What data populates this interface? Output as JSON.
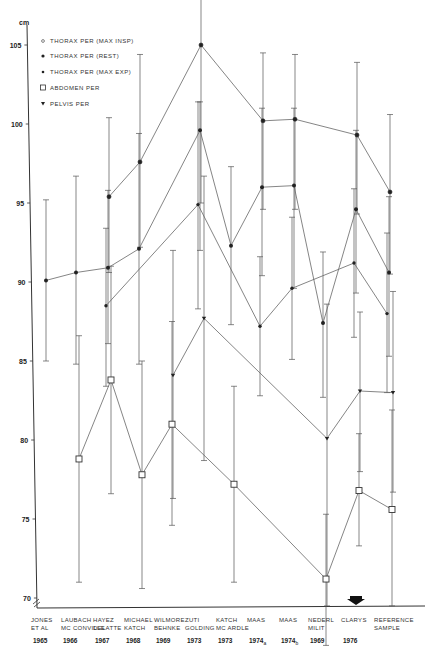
{
  "chart_data": {
    "type": "line",
    "title": "",
    "ylabel": "cm",
    "xlabel": "",
    "ylim": [
      69,
      106
    ],
    "yticks": [
      70,
      75,
      80,
      85,
      90,
      95,
      100,
      105
    ],
    "grid": false,
    "legend_position": "upper-left",
    "categories": [
      {
        "line1": "JONES",
        "line2": "ET AL",
        "year": "1965",
        "x": 46
      },
      {
        "line1": "LAUBACH",
        "line2": "MC CONVILLE",
        "year": "1966",
        "x": 76
      },
      {
        "line1": "HAYEZ",
        "line2": "DELATTE",
        "year": "1967",
        "x": 108
      },
      {
        "line1": "MICHAEL",
        "line2": "KATCH",
        "year": "1968",
        "x": 139
      },
      {
        "line1": "WILMORE",
        "line2": "BEHNKE",
        "year": "1969",
        "x": 169
      },
      {
        "line1": "ZUTI",
        "line2": "GOLDING",
        "year": "1973",
        "x": 200
      },
      {
        "line1": "KATCH",
        "line2": "MC ARDLE",
        "year": "1973",
        "x": 231
      },
      {
        "line1": "MAAS",
        "line2": "",
        "year": "1974a",
        "x": 262
      },
      {
        "line1": "MAAS",
        "line2": "",
        "year": "1974b",
        "x": 294
      },
      {
        "line1": "NEDERL",
        "line2": "MILIT",
        "year": "1969",
        "x": 323
      },
      {
        "line1": "CLARYS",
        "line2": "",
        "year": "1976",
        "x": 356
      },
      {
        "line1": "REFERENCE",
        "line2": "SAMPLE",
        "year": "",
        "x": 389
      }
    ],
    "series": [
      {
        "name": "THORAX PER (MAX INSP)",
        "marker": "open-circle",
        "values": [
          null,
          null,
          95.4,
          97.6,
          null,
          105.0,
          null,
          100.2,
          100.3,
          null,
          99.3,
          95.7
        ],
        "err_low": [
          null,
          null,
          90.6,
          92.2,
          null,
          95.0,
          null,
          94.6,
          94.6,
          null,
          94.3,
          90.5
        ],
        "err_high": [
          null,
          null,
          100.4,
          104.4,
          null,
          110.0,
          null,
          104.5,
          104.4,
          null,
          103.9,
          100.6
        ]
      },
      {
        "name": "THORAX PER (REST)",
        "marker": "filled-dot",
        "values": [
          90.1,
          90.6,
          90.9,
          92.1,
          null,
          99.6,
          92.3,
          96.0,
          96.1,
          87.4,
          94.6,
          90.6
        ],
        "err_low": [
          85.0,
          84.8,
          86.1,
          84.8,
          null,
          92.0,
          87.3,
          90.4,
          89.6,
          82.7,
          89.3,
          85.3
        ],
        "err_high": [
          95.2,
          96.7,
          95.8,
          99.4,
          null,
          101.4,
          97.3,
          101.0,
          101.0,
          91.9,
          99.6,
          95.4
        ]
      },
      {
        "name": "THORAX PER (MAX EXP)",
        "marker": "filled-small",
        "values": [
          null,
          null,
          88.5,
          null,
          null,
          94.9,
          null,
          87.2,
          89.6,
          null,
          91.2,
          88.0
        ],
        "err_low": [
          null,
          null,
          83.4,
          null,
          null,
          88.3,
          null,
          82.8,
          85.1,
          null,
          86.5,
          83.0
        ],
        "err_high": [
          null,
          null,
          93.4,
          null,
          null,
          101.4,
          null,
          91.6,
          94.1,
          null,
          95.9,
          93.1
        ]
      },
      {
        "name": "ABDOMEN PER",
        "marker": "open-square",
        "values": [
          null,
          78.8,
          83.8,
          77.8,
          81.0,
          null,
          77.2,
          null,
          null,
          71.2,
          76.8,
          75.6
        ],
        "err_low": [
          null,
          71.0,
          76.6,
          70.6,
          74.6,
          null,
          71.0,
          null,
          null,
          67.0,
          73.3,
          69.5
        ],
        "err_high": [
          null,
          86.6,
          91.0,
          85.0,
          87.5,
          null,
          83.4,
          null,
          null,
          75.3,
          80.4,
          81.9
        ]
      },
      {
        "name": "PELVIS PER",
        "marker": "filled-triangle",
        "values": [
          null,
          null,
          null,
          null,
          84.1,
          87.7,
          null,
          null,
          null,
          80.1,
          83.1,
          83.0
        ],
        "err_low": [
          null,
          null,
          null,
          null,
          76.3,
          78.7,
          null,
          null,
          null,
          69.5,
          78.0,
          76.7
        ],
        "err_high": [
          null,
          null,
          null,
          null,
          92.0,
          96.7,
          null,
          null,
          null,
          88.6,
          88.1,
          89.4
        ]
      }
    ],
    "annotations": [
      "arrow marker above CLARYS 1976"
    ]
  },
  "legend": {
    "items": [
      {
        "symbol": "○",
        "label": "THORAX  PER (MAX  INSP)"
      },
      {
        "symbol": "●",
        "label": "THORAX  PER (REST)"
      },
      {
        "symbol": "•",
        "label": "THORAX  PER (MAX  EXP)"
      },
      {
        "symbol": "□",
        "label": "ABDOMEN  PER"
      },
      {
        "symbol": "▾",
        "label": "PELVIS  PER"
      }
    ]
  },
  "axis": {
    "unit": "cm",
    "ticks": [
      "105",
      "100",
      "95",
      "90",
      "85",
      "80",
      "75",
      "70"
    ]
  },
  "year_labels": [
    "1965",
    "1966",
    "1967",
    "1968",
    "1969",
    "1973",
    "1973",
    "1974",
    "1974",
    "1969",
    "1976",
    ""
  ],
  "year_subscripts": {
    "7": "a",
    "8": "b"
  }
}
